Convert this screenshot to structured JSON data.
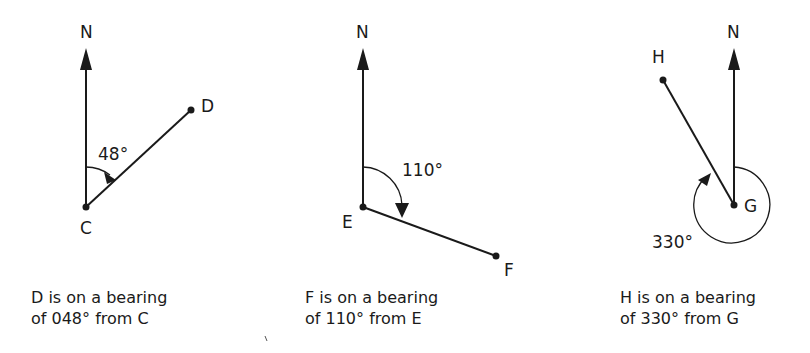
{
  "diagrams": [
    {
      "north_label": "N",
      "from_point": "C",
      "to_point": "D",
      "angle_label": "48°",
      "caption_line1": "D is on a bearing",
      "caption_line2": "of 048° from C"
    },
    {
      "north_label": "N",
      "from_point": "E",
      "to_point": "F",
      "angle_label": "110°",
      "caption_line1": "F is on a bearing",
      "caption_line2": "of 110° from E"
    },
    {
      "north_label": "N",
      "from_point": "G",
      "to_point": "H",
      "angle_label": "330°",
      "caption_line1": "H is on a bearing",
      "caption_line2": "of 330° from G"
    }
  ],
  "colors": {
    "ink": "#1a1a1a",
    "background": "#ffffff"
  }
}
